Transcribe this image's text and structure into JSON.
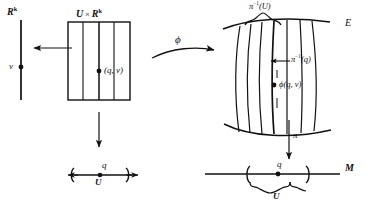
{
  "figure": {
    "type": "commutative-diagram",
    "background_color": "#ffffff",
    "ink_color": "#111111"
  },
  "left": {
    "fiber_axis_label": "R",
    "fiber_axis_exponent": "k",
    "fiber_point_label": "v",
    "box_label_left": "U",
    "box_label_times": "×",
    "box_label_right": "R",
    "box_label_exponent": "k",
    "box_point_label": "(q, v)",
    "base_point_label": "q",
    "base_brace_label": "U",
    "vertical_fiber_count": 5
  },
  "middle": {
    "phi_label": "ϕ",
    "projection_arrow_label": ""
  },
  "right": {
    "total_space_label": "E",
    "preimage_open_label_pi": "π",
    "preimage_open_label_exp": "−1",
    "preimage_open_label_arg": "(U)",
    "preimage_point_label_pi": "π",
    "preimage_point_label_exp": "−1",
    "preimage_point_label_arg": "(q)",
    "image_point_label": "ϕ(q, v)",
    "projection_label": "π",
    "base_space_label": "M",
    "base_point_label": "q",
    "base_brace_label": "U",
    "curved_fiber_count": 6
  }
}
